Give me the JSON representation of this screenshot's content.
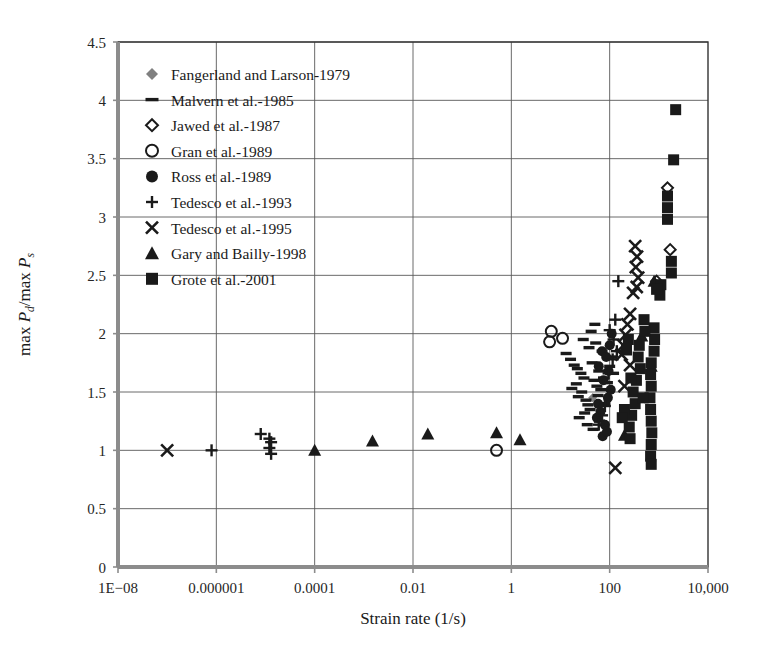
{
  "chart_data": {
    "type": "scatter",
    "title": "",
    "xlabel": "Strain rate (1/s)",
    "ylabel": "max Pd/max Ps",
    "ylabel_parts": {
      "pre": "max ",
      "p1": "P",
      "sub1": "d",
      "slash": "/max ",
      "p2": "P",
      "sub2": "s"
    },
    "xscale": "log",
    "yscale": "linear",
    "xlim": [
      1e-08,
      10000
    ],
    "ylim": [
      0,
      4.5
    ],
    "grid": true,
    "legend_position": "upper-left-inside",
    "xticklabels": [
      "1E−08",
      "0.000001",
      "0.0001",
      "0.01",
      "1",
      "100",
      "10,000"
    ],
    "xtickvalues": [
      1e-08,
      1e-06,
      0.0001,
      0.01,
      1,
      100,
      10000
    ],
    "yticklabels": [
      "0",
      "0.5",
      "1",
      "1.5",
      "2",
      "2.5",
      "3",
      "3.5",
      "4",
      "4.5"
    ],
    "ytickvalues": [
      0,
      0.5,
      1,
      1.5,
      2,
      2.5,
      3,
      3.5,
      4,
      4.5
    ],
    "series": [
      {
        "name": "Fangerland and Larson-1979",
        "marker": "diamond-filled",
        "color": "#808080",
        "size": 9,
        "points": [
          [
            45,
            1.45
          ]
        ]
      },
      {
        "name": "Malvern et al.-1985",
        "marker": "dash",
        "color": "#1a1a1a",
        "size": 11,
        "points": [
          [
            16,
            1.78
          ],
          [
            19,
            1.73
          ],
          [
            22,
            1.7
          ],
          [
            13,
            1.83
          ],
          [
            26,
            1.66
          ],
          [
            30,
            1.62
          ],
          [
            21,
            1.57
          ],
          [
            17,
            1.53
          ],
          [
            27,
            1.5
          ],
          [
            23,
            1.46
          ],
          [
            33,
            1.43
          ],
          [
            36,
            1.39
          ],
          [
            40,
            1.35
          ],
          [
            31,
            1.32
          ],
          [
            24,
            1.28
          ],
          [
            48,
            1.6
          ],
          [
            55,
            1.55
          ],
          [
            60,
            1.68
          ],
          [
            44,
            1.75
          ],
          [
            38,
            1.88
          ],
          [
            52,
            1.92
          ],
          [
            29,
            1.95
          ],
          [
            58,
            1.47
          ],
          [
            66,
            1.52
          ],
          [
            70,
            1.85
          ],
          [
            75,
            1.62
          ],
          [
            80,
            1.4
          ],
          [
            62,
            1.25
          ],
          [
            90,
            1.58
          ],
          [
            100,
            1.72
          ],
          [
            110,
            1.8
          ],
          [
            120,
            1.66
          ],
          [
            42,
            2.02
          ],
          [
            50,
            2.08
          ],
          [
            35,
            1.22
          ],
          [
            46,
            1.18
          ]
        ]
      },
      {
        "name": "Jawed et al.-1987",
        "marker": "diamond-open",
        "color": "#1a1a1a",
        "size": 11,
        "points": [
          [
            1500,
            3.25
          ],
          [
            1700,
            2.72
          ],
          [
            900,
            2.45
          ]
        ]
      },
      {
        "name": "Gran et al.-1989",
        "marker": "circle-open",
        "color": "#1a1a1a",
        "size": 11,
        "points": [
          [
            6.5,
            2.02
          ],
          [
            6.0,
            1.93
          ],
          [
            11,
            1.96
          ],
          [
            0.5,
            1.0
          ]
        ]
      },
      {
        "name": "Ross et al.-1989",
        "marker": "circle-filled",
        "color": "#1a1a1a",
        "size": 10,
        "points": [
          [
            70,
            1.85
          ],
          [
            85,
            1.8
          ],
          [
            60,
            1.72
          ],
          [
            95,
            1.68
          ],
          [
            75,
            1.6
          ],
          [
            65,
            1.33
          ],
          [
            55,
            1.28
          ],
          [
            80,
            1.22
          ],
          [
            72,
            1.12
          ],
          [
            88,
            1.16
          ],
          [
            100,
            1.9
          ],
          [
            110,
            2.0
          ],
          [
            58,
            1.4
          ],
          [
            92,
            1.45
          ],
          [
            105,
            1.52
          ]
        ]
      },
      {
        "name": "Tedesco et al.-1993",
        "marker": "plus",
        "color": "#1a1a1a",
        "size": 12,
        "points": [
          [
            8e-07,
            1.0
          ],
          [
            8e-06,
            1.14
          ],
          [
            1.2e-05,
            1.1
          ],
          [
            1.3e-05,
            1.07
          ],
          [
            1.2e-05,
            1.02
          ],
          [
            1.3e-05,
            0.97
          ],
          [
            100,
            2.03
          ],
          [
            130,
            2.12
          ],
          [
            150,
            2.45
          ],
          [
            115,
            1.78
          ],
          [
            95,
            1.66
          ],
          [
            80,
            1.38
          ],
          [
            70,
            1.3
          ],
          [
            60,
            1.22
          ],
          [
            120,
            1.95
          ],
          [
            140,
            1.85
          ]
        ]
      },
      {
        "name": "Tedesco et al.-1995",
        "marker": "cross",
        "color": "#1a1a1a",
        "size": 12,
        "points": [
          [
            1e-07,
            1.0
          ],
          [
            330,
            2.75
          ],
          [
            360,
            2.66
          ],
          [
            340,
            2.57
          ],
          [
            380,
            2.48
          ],
          [
            355,
            2.4
          ],
          [
            300,
            2.35
          ],
          [
            260,
            2.17
          ],
          [
            230,
            2.08
          ],
          [
            210,
            1.99
          ],
          [
            190,
            1.9
          ],
          [
            175,
            1.82
          ],
          [
            260,
            1.73
          ],
          [
            200,
            1.55
          ],
          [
            130,
            0.85
          ]
        ]
      },
      {
        "name": "Gary and Bailly-1998",
        "marker": "triangle-filled",
        "color": "#1a1a1a",
        "size": 11,
        "points": [
          [
            0.0001,
            1.0
          ],
          [
            0.0015,
            1.08
          ],
          [
            0.02,
            1.14
          ],
          [
            0.5,
            1.15
          ],
          [
            1.5,
            1.09
          ],
          [
            200,
            1.13
          ],
          [
            700,
            1.72
          ],
          [
            800,
            2.45
          ],
          [
            450,
            1.98
          ]
        ]
      },
      {
        "name": "Grote et al.-2001",
        "marker": "square-filled",
        "color": "#1a1a1a",
        "size": 11,
        "points": [
          [
            2200,
            3.92
          ],
          [
            2000,
            3.49
          ],
          [
            1500,
            3.18
          ],
          [
            1500,
            3.08
          ],
          [
            1500,
            2.98
          ],
          [
            1800,
            2.62
          ],
          [
            1800,
            2.52
          ],
          [
            1100,
            2.42
          ],
          [
            1050,
            2.33
          ],
          [
            900,
            2.38
          ],
          [
            800,
            2.05
          ],
          [
            820,
            1.95
          ],
          [
            800,
            1.85
          ],
          [
            700,
            1.75
          ],
          [
            680,
            1.65
          ],
          [
            700,
            1.55
          ],
          [
            660,
            1.45
          ],
          [
            680,
            1.35
          ],
          [
            700,
            1.25
          ],
          [
            720,
            1.15
          ],
          [
            700,
            1.05
          ],
          [
            680,
            0.95
          ],
          [
            700,
            0.88
          ],
          [
            400,
            1.9
          ],
          [
            380,
            1.8
          ],
          [
            420,
            1.7
          ],
          [
            350,
            1.6
          ],
          [
            300,
            1.5
          ],
          [
            330,
            1.4
          ],
          [
            280,
            1.3
          ],
          [
            250,
            1.2
          ],
          [
            270,
            1.62
          ],
          [
            500,
            2.12
          ],
          [
            520,
            2.02
          ],
          [
            480,
            1.45
          ],
          [
            240,
            1.95
          ],
          [
            220,
            1.86
          ],
          [
            200,
            1.35
          ],
          [
            180,
            1.28
          ],
          [
            260,
            1.1
          ]
        ]
      }
    ]
  },
  "legend": {
    "items": [
      {
        "label": "Fangerland and Larson-1979",
        "marker": "diamond-filled",
        "color": "#808080"
      },
      {
        "label": "Malvern et al.-1985",
        "marker": "dash",
        "color": "#1a1a1a"
      },
      {
        "label": "Jawed et al.-1987",
        "marker": "diamond-open",
        "color": "#1a1a1a"
      },
      {
        "label": "Gran et al.-1989",
        "marker": "circle-open",
        "color": "#1a1a1a"
      },
      {
        "label": "Ross et al.-1989",
        "marker": "circle-filled",
        "color": "#1a1a1a"
      },
      {
        "label": "Tedesco et al.-1993",
        "marker": "plus",
        "color": "#1a1a1a"
      },
      {
        "label": "Tedesco et al.-1995",
        "marker": "cross",
        "color": "#1a1a1a"
      },
      {
        "label": "Gary and Bailly-1998",
        "marker": "triangle-filled",
        "color": "#1a1a1a"
      },
      {
        "label": "Grote et al.-2001",
        "marker": "square-filled",
        "color": "#1a1a1a"
      }
    ]
  },
  "style": {
    "grid_color": "#595959",
    "frame_color": "#333333",
    "text_color": "#1a1a1a",
    "background": "#ffffff"
  }
}
